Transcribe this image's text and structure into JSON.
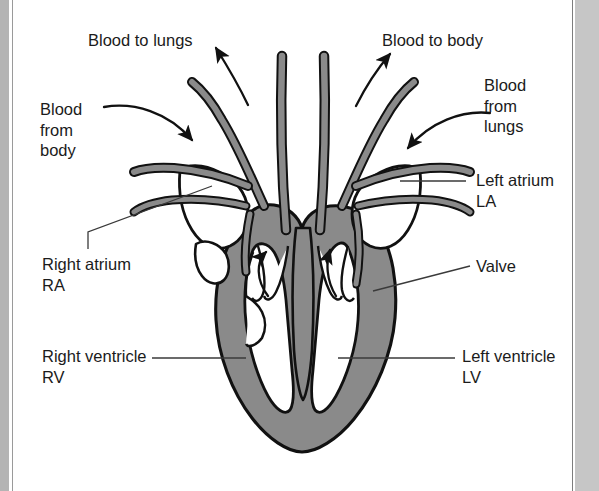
{
  "figure": {
    "colors": {
      "myocardium_fill": "#8a8a8a",
      "vessel_wall_fill": "#8a8a8a",
      "chamber_fill": "#ffffff",
      "outline": "#111111",
      "text": "#1b1b1b",
      "leader_line": "#3a3a3a",
      "page_background": "#ffffff",
      "gutter_left": "#b4b4b4",
      "gutter_right": "#c6c6c6"
    },
    "labels": {
      "blood_to_lungs": "Blood to lungs",
      "blood_to_body": "Blood to body",
      "blood_from_body": "Blood\nfrom\nbody",
      "blood_from_lungs": "Blood\nfrom\nlungs",
      "left_atrium": "Left atrium\nLA",
      "right_atrium": "Right atrium\nRA",
      "left_ventricle": "Left ventricle\nLV",
      "right_ventricle": "Right ventricle\nRV",
      "valve": "Valve"
    },
    "flow_arrows": [
      {
        "name": "to-lungs-arrow",
        "direction": "up-left",
        "meaning": "deoxygenated blood leaving right ventricle to pulmonary artery"
      },
      {
        "name": "to-body-arrow",
        "direction": "up-right",
        "meaning": "oxygenated blood leaving left ventricle to aorta"
      },
      {
        "name": "from-body-arrow",
        "direction": "down-right",
        "meaning": "deoxygenated blood entering right atrium from vena cava"
      },
      {
        "name": "from-lungs-arrow",
        "direction": "down-left",
        "meaning": "oxygenated blood entering left atrium from pulmonary vein"
      },
      {
        "name": "right-ventricle-arrow",
        "direction": "up",
        "meaning": "blood pumped up out of right ventricle"
      },
      {
        "name": "left-ventricle-arrow",
        "direction": "up",
        "meaning": "blood pumped up out of left ventricle"
      }
    ]
  }
}
